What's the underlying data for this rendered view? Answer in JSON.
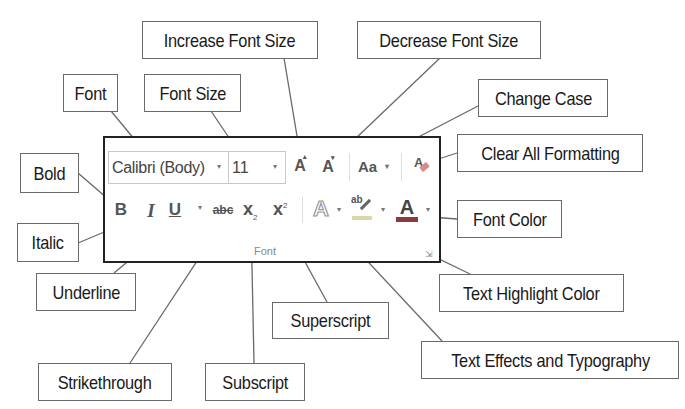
{
  "callouts": {
    "increase_font_size": "Increase Font Size",
    "decrease_font_size": "Decrease Font Size",
    "font": "Font",
    "font_size": "Font Size",
    "change_case": "Change Case",
    "clear_all_formatting": "Clear All Formatting",
    "bold": "Bold",
    "italic": "Italic",
    "font_color": "Font Color",
    "underline": "Underline",
    "text_highlight_color": "Text Highlight Color",
    "superscript": "Superscript",
    "text_effects": "Text Effects and Typography",
    "strikethrough": "Strikethrough",
    "subscript": "Subscript"
  },
  "ribbon": {
    "group_label": "Font",
    "font_name": "Calibri (Body)",
    "font_size": "11",
    "increase_glyph": "A",
    "decrease_glyph": "A",
    "change_case_glyph": "Aa",
    "clear_glyph": "A",
    "bold_glyph": "B",
    "italic_glyph": "I",
    "underline_glyph": "U",
    "strikethrough_glyph": "abc",
    "subscript_glyph": "x",
    "subscript_sub": "2",
    "superscript_glyph": "x",
    "superscript_sup": "2",
    "text_effects_glyph": "A",
    "highlight_glyph": "ab",
    "font_color_glyph": "A",
    "dialog_launcher_glyph": "⇲",
    "dropdown_glyph": "▾"
  },
  "colors": {
    "highlight_bar": "#d8d8a8",
    "font_color_bar": "#8a3b3b",
    "clear_eraser": "#d98a8a"
  }
}
